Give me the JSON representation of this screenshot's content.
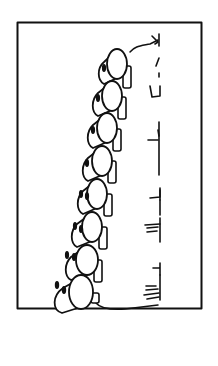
{
  "figure": {
    "colors": {
      "ink": "#111111",
      "background": "#ffffff"
    },
    "frame": {
      "x": 17,
      "y": 22,
      "width": 184,
      "height": 286
    },
    "segments": [
      {
        "cx": 117,
        "cy": 62
      },
      {
        "cx": 112,
        "cy": 95
      },
      {
        "cx": 107,
        "cy": 127
      },
      {
        "cx": 102,
        "cy": 160
      },
      {
        "cx": 97,
        "cy": 193
      },
      {
        "cx": 92,
        "cy": 226
      },
      {
        "cx": 87,
        "cy": 259
      },
      {
        "cx": 82,
        "cy": 292
      }
    ]
  }
}
